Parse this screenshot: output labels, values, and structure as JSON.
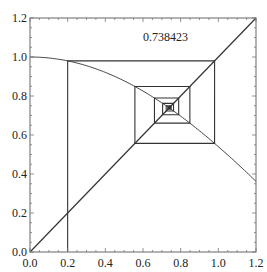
{
  "chart_data": {
    "type": "line",
    "title": "",
    "annotation": "0.738423",
    "xlabel": "",
    "ylabel": "",
    "xlim": [
      0.0,
      1.2
    ],
    "ylim": [
      0.0,
      1.2
    ],
    "x_ticks": [
      "0.0",
      "0.2",
      "0.4",
      "0.6",
      "0.8",
      "1.0",
      "1.2"
    ],
    "y_ticks": [
      "0.0",
      "0.2",
      "0.4",
      "0.6",
      "0.8",
      "1.0",
      "1.2"
    ],
    "grid": false,
    "legend": null,
    "series": [
      {
        "name": "f(x) = cos(x)",
        "kind": "curve",
        "x": [
          0.0,
          0.1,
          0.2,
          0.3,
          0.4,
          0.5,
          0.6,
          0.7,
          0.8,
          0.9,
          1.0,
          1.1,
          1.2
        ],
        "y": [
          1.0,
          0.995,
          0.98,
          0.955,
          0.921,
          0.878,
          0.825,
          0.765,
          0.697,
          0.622,
          0.54,
          0.454,
          0.362
        ]
      },
      {
        "name": "y = x",
        "kind": "line",
        "x": [
          0.0,
          1.2
        ],
        "y": [
          0.0,
          1.2
        ]
      },
      {
        "name": "cobweb",
        "kind": "iteration",
        "x0": 0.2,
        "iterates": [
          0.2,
          0.980067,
          0.556967,
          0.848862,
          0.660838,
          0.789478,
          0.704216,
          0.762097,
          0.723345,
          0.749407,
          0.731902,
          0.743691,
          0.735771,
          0.741106,
          0.737517,
          0.739935,
          0.738306,
          0.739403
        ]
      }
    ]
  },
  "frame": {
    "left": 30,
    "right": 256,
    "top": 18,
    "bottom": 252
  },
  "colors": {
    "axis": "#555555",
    "line": "#333333",
    "curve": "#444444"
  }
}
